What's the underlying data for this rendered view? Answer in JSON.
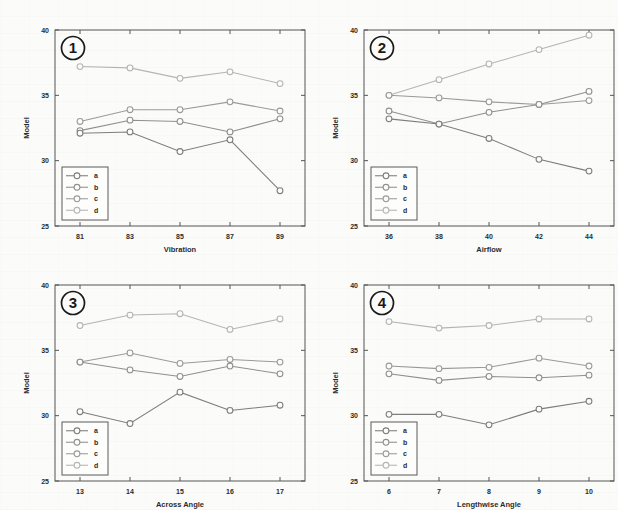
{
  "figure": {
    "background_color": "#fbfbfa",
    "axis_color": "#555555",
    "panel_count": 4
  },
  "series_colors": {
    "a": "#7d7d7d",
    "b": "#8f8f8f",
    "c": "#9a9a9a",
    "d": "#b4b4b4"
  },
  "legend": {
    "entries": [
      "a",
      "b",
      "c",
      "d"
    ]
  },
  "shared": {
    "ylabel": "Model",
    "yticks": [
      "25",
      "30",
      "35",
      "40"
    ],
    "ylim": [
      25,
      40
    ]
  },
  "chart_data": [
    {
      "panel": "1",
      "type": "line",
      "title": "",
      "xlabel": "Vibration",
      "ylabel": "Model",
      "x": [
        81,
        83,
        85,
        87,
        89
      ],
      "xticklabels": [
        "81",
        "83",
        "85",
        "87",
        "89"
      ],
      "xlim": [
        80,
        90
      ],
      "ylim": [
        25,
        40
      ],
      "yticklabels": [
        "25",
        "30",
        "35",
        "40"
      ],
      "grid": false,
      "legend_position": "lower-left",
      "series": [
        {
          "name": "a",
          "values": [
            32.1,
            32.2,
            30.7,
            31.6,
            27.7
          ]
        },
        {
          "name": "b",
          "values": [
            32.3,
            33.1,
            33.0,
            32.2,
            33.2
          ]
        },
        {
          "name": "c",
          "values": [
            33.0,
            33.9,
            33.9,
            34.5,
            33.8
          ]
        },
        {
          "name": "d",
          "values": [
            37.2,
            37.1,
            36.3,
            36.8,
            35.9
          ]
        }
      ]
    },
    {
      "panel": "2",
      "type": "line",
      "title": "",
      "xlabel": "Airflow",
      "ylabel": "Model",
      "x": [
        36,
        38,
        40,
        42,
        44
      ],
      "xticklabels": [
        "36",
        "38",
        "40",
        "42",
        "44"
      ],
      "xlim": [
        35,
        45
      ],
      "ylim": [
        25,
        40
      ],
      "yticklabels": [
        "25",
        "30",
        "35",
        "40"
      ],
      "grid": false,
      "legend_position": "lower-left",
      "series": [
        {
          "name": "a",
          "values": [
            33.2,
            32.8,
            31.7,
            30.1,
            29.2
          ]
        },
        {
          "name": "b",
          "values": [
            33.8,
            32.8,
            33.7,
            34.3,
            35.3
          ]
        },
        {
          "name": "c",
          "values": [
            35.0,
            34.8,
            34.5,
            34.3,
            34.6
          ]
        },
        {
          "name": "d",
          "values": [
            35.0,
            36.2,
            37.4,
            38.5,
            39.6
          ]
        }
      ]
    },
    {
      "panel": "3",
      "type": "line",
      "title": "",
      "xlabel": "Across Angle",
      "ylabel": "Model",
      "x": [
        13,
        14,
        15,
        16,
        17
      ],
      "xticklabels": [
        "13",
        "14",
        "15",
        "16",
        "17"
      ],
      "xlim": [
        12.5,
        17.5
      ],
      "ylim": [
        25,
        40
      ],
      "yticklabels": [
        "25",
        "30",
        "35",
        "40"
      ],
      "grid": false,
      "legend_position": "lower-left",
      "series": [
        {
          "name": "a",
          "values": [
            30.3,
            29.4,
            31.8,
            30.4,
            30.8
          ]
        },
        {
          "name": "b",
          "values": [
            34.1,
            33.5,
            33.0,
            33.8,
            33.2
          ]
        },
        {
          "name": "c",
          "values": [
            34.1,
            34.8,
            34.0,
            34.3,
            34.1
          ]
        },
        {
          "name": "d",
          "values": [
            36.9,
            37.7,
            37.8,
            36.6,
            37.4
          ]
        }
      ]
    },
    {
      "panel": "4",
      "type": "line",
      "title": "",
      "xlabel": "Lengthwise Angle",
      "ylabel": "Model",
      "x": [
        6,
        7,
        8,
        9,
        10
      ],
      "xticklabels": [
        "6",
        "7",
        "8",
        "9",
        "10"
      ],
      "xlim": [
        5.5,
        10.5
      ],
      "ylim": [
        25,
        40
      ],
      "yticklabels": [
        "25",
        "30",
        "35",
        "40"
      ],
      "grid": false,
      "legend_position": "lower-left",
      "series": [
        {
          "name": "a",
          "values": [
            30.1,
            30.1,
            29.3,
            30.5,
            31.1
          ]
        },
        {
          "name": "b",
          "values": [
            33.2,
            32.7,
            33.0,
            32.9,
            33.1
          ]
        },
        {
          "name": "c",
          "values": [
            33.8,
            33.6,
            33.7,
            34.4,
            33.8
          ]
        },
        {
          "name": "d",
          "values": [
            37.2,
            36.7,
            36.9,
            37.4,
            37.4
          ]
        }
      ]
    }
  ]
}
